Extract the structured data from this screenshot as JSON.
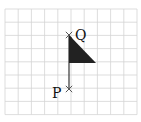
{
  "diagram": {
    "type": "flag-on-grid",
    "grid": {
      "x0": 5,
      "y0": 9,
      "cols": 10,
      "rows": 8,
      "cell": 13.2,
      "line_color": "#d4d4d4"
    },
    "points": [
      {
        "id": "Q",
        "label": "Q",
        "x": 69,
        "y": 35,
        "label_dx": 6,
        "label_dy": 5
      },
      {
        "id": "P",
        "label": "P",
        "x": 69,
        "y": 89,
        "label_dx": -17,
        "label_dy": 9
      }
    ],
    "pole": {
      "from": "Q",
      "to": "P",
      "color": "#444444"
    },
    "flag": {
      "vertices": [
        [
          69,
          35
        ],
        [
          96,
          63
        ],
        [
          69,
          63
        ]
      ],
      "fill": "#222222"
    },
    "marker_color": "#555555"
  }
}
